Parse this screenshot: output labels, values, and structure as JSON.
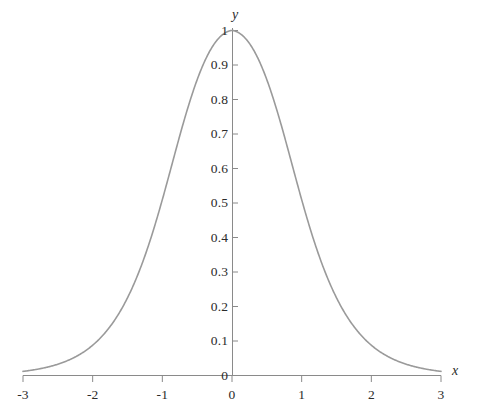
{
  "chart_data": {
    "type": "line",
    "title": "",
    "subtitle": "",
    "xlabel": "x",
    "ylabel": "y",
    "xlim": [
      -3,
      3
    ],
    "ylim": [
      0,
      1
    ],
    "grid": false,
    "legend": null,
    "curve_color": "#9a9a9a",
    "axis_color": "#8a8a8a",
    "text_color": "#2b2b2b",
    "x_ticks": [
      -3,
      -2,
      -1,
      0,
      1,
      2,
      3
    ],
    "x_tick_labels": [
      "-3",
      "-2",
      "-1",
      "0",
      "1",
      "2",
      "3"
    ],
    "y_ticks": [
      0,
      0.1,
      0.2,
      0.3,
      0.4,
      0.5,
      0.6,
      0.7,
      0.8,
      0.9,
      1
    ],
    "y_tick_labels": [
      "0",
      "0.1",
      "0.2",
      "0.3",
      "0.4",
      "0.5",
      "0.6",
      "0.7",
      "0.8",
      "0.9",
      "1"
    ],
    "series": [
      {
        "name": "bell-curve",
        "x": [
          -3.0,
          -2.9,
          -2.8,
          -2.7,
          -2.6,
          -2.5,
          -2.4,
          -2.3,
          -2.2,
          -2.1,
          -2.0,
          -1.9,
          -1.8,
          -1.7,
          -1.6,
          -1.5,
          -1.4,
          -1.3,
          -1.2,
          -1.1,
          -1.0,
          -0.9,
          -0.8,
          -0.7,
          -0.6,
          -0.5,
          -0.4,
          -0.3,
          -0.2,
          -0.1,
          0.0,
          0.1,
          0.2,
          0.3,
          0.4,
          0.5,
          0.6,
          0.7,
          0.8,
          0.9,
          1.0,
          1.1,
          1.2,
          1.3,
          1.4,
          1.5,
          1.6,
          1.7,
          1.8,
          1.9,
          2.0,
          2.1,
          2.2,
          2.3,
          2.4,
          2.5,
          2.6,
          2.7,
          2.8,
          2.9,
          3.0
        ],
        "y": [
          0.0099,
          0.0121,
          0.0148,
          0.0181,
          0.0221,
          0.0269,
          0.0329,
          0.0401,
          0.0489,
          0.0595,
          0.0723,
          0.0878,
          0.1064,
          0.1285,
          0.1547,
          0.1856,
          0.2215,
          0.2629,
          0.31,
          0.3627,
          0.42,
          0.4806,
          0.5422,
          0.6021,
          0.6574,
          0.7065,
          0.7477,
          0.7803,
          0.8038,
          0.8183,
          0.824,
          0.8183,
          0.8038,
          0.7803,
          0.7477,
          0.7065,
          0.6574,
          0.6021,
          0.5422,
          0.4806,
          0.42,
          0.3627,
          0.31,
          0.2629,
          0.2215,
          0.1856,
          0.1547,
          0.1285,
          0.1064,
          0.0878,
          0.0723,
          0.0595,
          0.0489,
          0.0401,
          0.0329,
          0.0269,
          0.0221,
          0.0181,
          0.0148,
          0.0121,
          0.0099
        ]
      }
    ],
    "annotations": []
  },
  "axes": {
    "x_axis_name": "x",
    "y_axis_name": "y"
  },
  "x_tick_labels": [
    "-3",
    "-2",
    "-1",
    "0",
    "1",
    "2",
    "3"
  ],
  "y_tick_labels": [
    "0",
    "0.1",
    "0.2",
    "0.3",
    "0.4",
    "0.5",
    "0.6",
    "0.7",
    "0.8",
    "0.9",
    "1"
  ]
}
